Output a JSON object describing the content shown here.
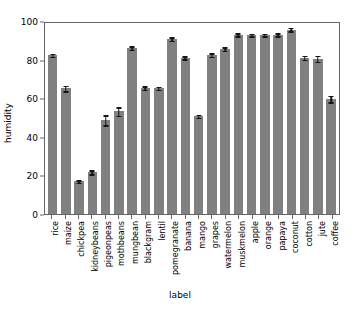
{
  "chart_data": {
    "type": "bar",
    "title": "",
    "xlabel": "label",
    "ylabel": "humidity",
    "ylim": [
      0,
      100
    ],
    "yticks": [
      0,
      20,
      40,
      60,
      80,
      100
    ],
    "grid": false,
    "legend": null,
    "bar_color": "#808080",
    "error_bar_color": "#151515",
    "categories": [
      "rice",
      "maize",
      "chickpea",
      "kidneybeans",
      "pigeonpeas",
      "mothbeans",
      "mungbean",
      "blackgram",
      "lentil",
      "pomegranate",
      "banana",
      "mango",
      "grapes",
      "watermelon",
      "muskmelon",
      "apple",
      "orange",
      "papaya",
      "coconut",
      "cotton",
      "jute",
      "coffee"
    ],
    "values": [
      82.3,
      65.1,
      16.9,
      21.6,
      48.6,
      53.2,
      85.9,
      65.2,
      65.1,
      90.6,
      80.9,
      50.6,
      82.3,
      85.5,
      92.9,
      92.8,
      92.8,
      92.9,
      95.5,
      80.9,
      80.4,
      59.6
    ],
    "errors": [
      0.8,
      1.4,
      0.7,
      1.0,
      2.6,
      2.2,
      0.9,
      0.9,
      0.8,
      0.9,
      0.8,
      0.8,
      0.9,
      0.9,
      0.8,
      0.7,
      0.7,
      0.7,
      0.9,
      1.0,
      1.6,
      1.6
    ]
  }
}
